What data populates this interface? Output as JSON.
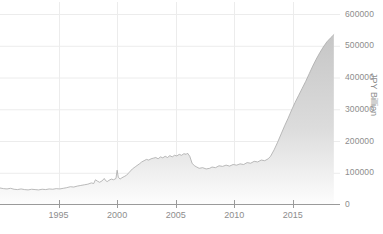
{
  "chart_data": {
    "type": "area",
    "title": "",
    "subtitle": "",
    "xlabel": "",
    "ylabel": "JPY Billion",
    "ylim": [
      0,
      600000
    ],
    "xlim": [
      1990.0,
      2018.6
    ],
    "grid": true,
    "legend": false,
    "series_name": "Japan Central Bank Balance Sheet",
    "yticks": [
      0,
      100000,
      200000,
      300000,
      400000,
      500000,
      600000
    ],
    "ytick_labels": [
      "0",
      "100000",
      "200000",
      "300000",
      "400000",
      "500000",
      "600000"
    ],
    "xticks": [
      1995,
      2000,
      2005,
      2010,
      2015
    ],
    "xtick_labels": [
      "1995",
      "2000",
      "2005",
      "2010",
      "2015"
    ],
    "colors": {
      "area_fill_top": "#c9c9c9",
      "area_fill_bottom": "#fbfbfb",
      "line": "#a8a8a8",
      "grid": "#ececec",
      "axis": "#9a9a9a",
      "text": "#8d8d8d",
      "background": "#ffffff"
    },
    "x": [
      1990.0,
      1990.3,
      1990.6,
      1990.9,
      1991.2,
      1991.5,
      1991.8,
      1992.1,
      1992.4,
      1992.7,
      1993.0,
      1993.3,
      1993.6,
      1993.9,
      1994.2,
      1994.5,
      1994.8,
      1995.1,
      1995.4,
      1995.7,
      1996.0,
      1996.3,
      1996.6,
      1996.9,
      1997.2,
      1997.5,
      1997.8,
      1998.0,
      1998.15,
      1998.3,
      1998.5,
      1998.7,
      1998.9,
      1999.0,
      1999.15,
      1999.3,
      1999.5,
      1999.7,
      1999.9,
      2000.0,
      2000.1,
      2000.25,
      2000.4,
      2000.6,
      2000.8,
      2001.0,
      2001.3,
      2001.6,
      2001.9,
      2002.1,
      2002.3,
      2002.5,
      2002.7,
      2002.9,
      2003.1,
      2003.3,
      2003.5,
      2003.7,
      2003.9,
      2004.1,
      2004.3,
      2004.5,
      2004.7,
      2004.9,
      2005.1,
      2005.3,
      2005.5,
      2005.7,
      2005.9,
      2006.0,
      2006.2,
      2006.4,
      2006.6,
      2006.8,
      2007.0,
      2007.3,
      2007.6,
      2007.9,
      2008.1,
      2008.4,
      2008.7,
      2009.0,
      2009.3,
      2009.6,
      2009.9,
      2010.2,
      2010.5,
      2010.8,
      2011.1,
      2011.4,
      2011.7,
      2012.0,
      2012.3,
      2012.6,
      2012.9,
      2013.1,
      2013.4,
      2013.7,
      2014.0,
      2014.3,
      2014.6,
      2014.9,
      2015.2,
      2015.5,
      2015.8,
      2016.1,
      2016.4,
      2016.7,
      2017.0,
      2017.3,
      2017.6,
      2017.9,
      2018.2,
      2018.5
    ],
    "values": [
      52000,
      50000,
      49000,
      51000,
      48000,
      47000,
      49000,
      47000,
      46000,
      48000,
      47000,
      46000,
      48000,
      47000,
      49000,
      48000,
      50000,
      49000,
      51000,
      53000,
      56000,
      55000,
      58000,
      60000,
      62000,
      64000,
      68000,
      66000,
      78000,
      74000,
      70000,
      74000,
      82000,
      76000,
      72000,
      76000,
      80000,
      78000,
      82000,
      108000,
      86000,
      80000,
      84000,
      88000,
      92000,
      100000,
      112000,
      120000,
      128000,
      134000,
      138000,
      142000,
      140000,
      144000,
      146000,
      148000,
      144000,
      150000,
      147000,
      152000,
      148000,
      154000,
      150000,
      155000,
      153000,
      158000,
      155000,
      160000,
      158000,
      162000,
      152000,
      130000,
      122000,
      118000,
      114000,
      116000,
      112000,
      114000,
      118000,
      116000,
      122000,
      120000,
      124000,
      121000,
      126000,
      124000,
      128000,
      126000,
      132000,
      130000,
      136000,
      134000,
      140000,
      138000,
      144000,
      152000,
      172000,
      196000,
      222000,
      248000,
      272000,
      298000,
      322000,
      344000,
      366000,
      388000,
      412000,
      436000,
      458000,
      478000,
      496000,
      512000,
      524000,
      535000
    ],
    "data_notes": {
      "peak_value": 535000,
      "peak_year": 2018.5,
      "start_value": 52000,
      "start_year": 1990.0,
      "plateau_2002_2006_value": 155000,
      "trough_2007_value": 112000
    }
  },
  "axes": {
    "y_title": "JPY Billion"
  }
}
